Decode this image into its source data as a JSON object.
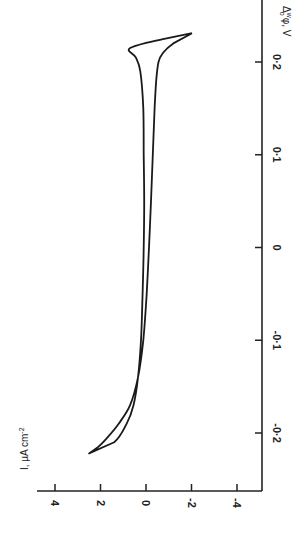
{
  "chart_data": {
    "type": "line",
    "title": "",
    "orientation": "rotated 90° (potential axis vertical on right, current axis horizontal at bottom)",
    "xlabel": "Δ_o^w φ, V",
    "ylabel": "I, µA cm⁻²",
    "xlim": [
      -0.25,
      0.25
    ],
    "ylim": [
      -5,
      5
    ],
    "x_ticks": [
      0.2,
      0.1,
      0,
      -0.1,
      -0.2
    ],
    "x_tick_labels": [
      "0·2",
      "0·1",
      "0",
      "-0·1",
      "-0·2"
    ],
    "y_ticks": [
      4,
      2,
      0,
      -2,
      -4
    ],
    "y_tick_labels": [
      "4",
      "2",
      "0",
      "-2",
      "-4"
    ],
    "grid": false,
    "legend": null,
    "series": [
      {
        "name": "cyclic voltammogram",
        "closed": true,
        "x": [
          0.231,
          0.22,
          0.21,
          0.2,
          0.18,
          0.15,
          0.1,
          0.05,
          0.0,
          -0.05,
          -0.1,
          -0.14,
          -0.17,
          -0.19,
          -0.205,
          -0.215,
          -0.222,
          -0.21,
          -0.19,
          -0.17,
          -0.14,
          -0.1,
          -0.05,
          0.0,
          0.05,
          0.1,
          0.15,
          0.19,
          0.205,
          0.215,
          0.225,
          0.231
        ],
        "y": [
          -2.02,
          -1.2,
          -0.75,
          -0.55,
          -0.45,
          -0.38,
          -0.3,
          -0.22,
          -0.13,
          -0.03,
          0.12,
          0.35,
          0.7,
          1.2,
          1.7,
          2.1,
          2.5,
          1.4,
          0.85,
          0.55,
          0.35,
          0.22,
          0.15,
          0.1,
          0.08,
          0.1,
          0.12,
          0.25,
          0.45,
          0.7,
          -0.8,
          -2.02
        ]
      }
    ]
  },
  "axes": {
    "potential_label": "Δ",
    "potential_label_sup": "w",
    "potential_label_sub": "o",
    "potential_label_rest": "φ, V",
    "current_label": "I, µA  cm",
    "current_label_exp": "-2"
  }
}
